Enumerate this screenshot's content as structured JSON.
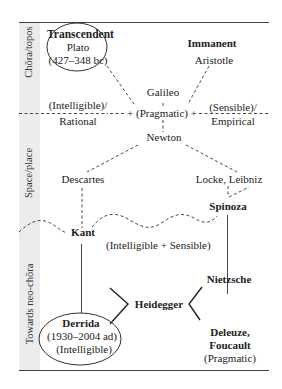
{
  "diagram": {
    "sections": [
      {
        "id": "chora",
        "label": "Chōra/topos"
      },
      {
        "id": "space",
        "label": "Space/place"
      },
      {
        "id": "neo",
        "label": "Towards neo-chōra"
      }
    ],
    "nodes": {
      "transcendent": {
        "title": "Transcendent",
        "name": "Plato",
        "dates": "(427–348 bc)"
      },
      "immanent": {
        "title": "Immanent",
        "name": "Aristotle"
      },
      "galileo": "Galileo",
      "pragmatic_center": "+ (Pragmatic) +",
      "intelligible_left_1": "(Intelligible)/",
      "intelligible_left_2": "Rational",
      "sensible_right_1": "(Sensible)/",
      "sensible_right_2": "Empirical",
      "newton": "Newton",
      "descartes": "Descartes",
      "locke_leibniz": "Locke, Leibniz",
      "spinoza": "Spinoza",
      "kant": "Kant",
      "intelligible_sensible": "(Intelligible + Sensible)",
      "nietzsche": "Nietzsche",
      "heidegger": "Heidegger",
      "deleuze_foucault_1": "Deleuze,",
      "deleuze_foucault_2": "Foucault",
      "pragmatic_bottom": "(Pragmatic)",
      "derrida": {
        "name": "Derrida",
        "dates": "(1930–2004 ad)",
        "note": "(Intelligible)"
      }
    }
  }
}
